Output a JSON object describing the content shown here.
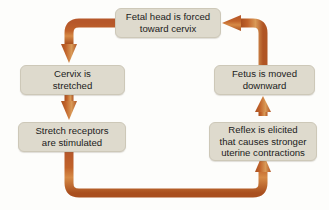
{
  "diagram": {
    "type": "cycle-flowchart",
    "direction": "clockwise",
    "colors": {
      "box_fill": "#dedacd",
      "box_border": "#cdc8b8",
      "arrow": "#c1632a",
      "arrow_highlight": "#e0a054",
      "arrow_shadow": "#9c4a1c",
      "text": "#1b1b1b",
      "background": "#fdfdfb"
    },
    "nodes": [
      {
        "id": "fetal-head",
        "label": "Fetal head is forced\ntoward cervix"
      },
      {
        "id": "cervix",
        "label": "Cervix is\nstretched"
      },
      {
        "id": "stretch-receptors",
        "label": "Stretch receptors\nare stimulated"
      },
      {
        "id": "reflex",
        "label": "Reflex is elicited\nthat causes stronger\nuterine contractions"
      },
      {
        "id": "fetus",
        "label": "Fetus is moved\ndownward"
      }
    ],
    "edges": [
      {
        "id": "edge-fetal-head-to-cervix",
        "from": "fetal-head",
        "to": "cervix",
        "shape": "elbow-down-left",
        "arrowhead": "down"
      },
      {
        "id": "edge-cervix-to-stretch",
        "from": "cervix",
        "to": "stretch-receptors",
        "shape": "straight-vertical",
        "arrowhead": "down"
      },
      {
        "id": "edge-stretch-to-reflex",
        "from": "stretch-receptors",
        "to": "reflex",
        "shape": "elbow-down-right-up",
        "arrowhead": "up"
      },
      {
        "id": "edge-reflex-to-fetus",
        "from": "reflex",
        "to": "fetus",
        "shape": "straight-vertical",
        "arrowhead": "up"
      },
      {
        "id": "edge-fetus-to-fetal-head",
        "from": "fetus",
        "to": "fetal-head",
        "shape": "elbow-up-left",
        "arrowhead": "left"
      }
    ]
  }
}
